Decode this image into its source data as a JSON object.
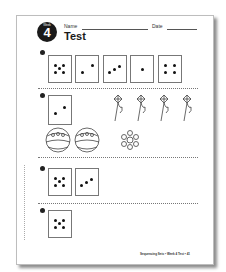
{
  "header": {
    "badge_week_label": "Week",
    "badge_number": "4",
    "name_label": "Name",
    "date_label": "Date",
    "title": "Test"
  },
  "questions": [
    {
      "number": "1",
      "cards": [
        5,
        2,
        3,
        1,
        4
      ]
    },
    {
      "number": "2",
      "cards": [
        2
      ],
      "pictures": [
        "kite",
        "kite",
        "kite",
        "kite",
        "ball",
        "ball",
        "flower"
      ]
    },
    {
      "number": "3",
      "cards": [
        5,
        3
      ]
    },
    {
      "number": "4",
      "cards": [
        5
      ]
    }
  ],
  "footer": {
    "text": "Sequencing Sets • Week 4 Test • 41"
  }
}
